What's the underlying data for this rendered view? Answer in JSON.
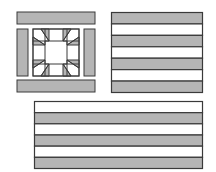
{
  "colors": {
    "background": "#ffffff",
    "fill_gray": "#b5b5b5",
    "fill_white": "#ffffff",
    "stroke": "#3a3a3a"
  },
  "panels": [
    {
      "name": "star-block-panel",
      "description": "Quilt block with border bars and central eight-point star"
    },
    {
      "name": "stripe-panel-square",
      "stripes": [
        "gray",
        "white",
        "gray",
        "white",
        "gray",
        "white",
        "gray"
      ]
    },
    {
      "name": "stripe-panel-wide",
      "stripes": [
        "white",
        "gray",
        "white",
        "gray",
        "white",
        "gray"
      ]
    }
  ]
}
